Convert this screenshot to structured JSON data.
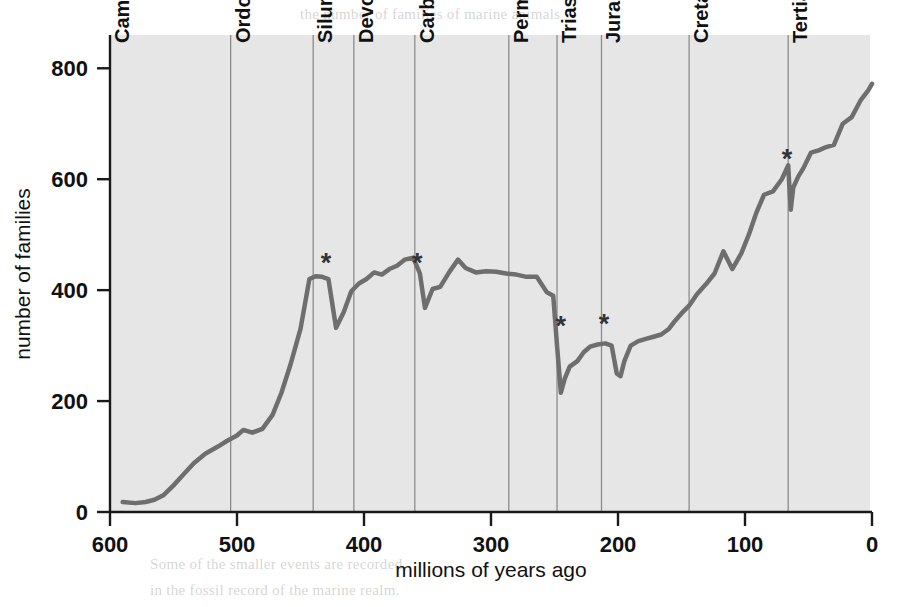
{
  "figure": {
    "background_color": "#ffffff",
    "plot_background_color": "#e6e6e6",
    "curve_color": "#6e6e6e",
    "axis_color": "#1a1a1a",
    "gridline_color": "#8c8c8c",
    "extinction_marker_glyph": "*"
  },
  "chart_data": {
    "type": "line",
    "title": "",
    "xlabel": "millions of years ago",
    "ylabel": "number of families",
    "xlim": [
      600,
      0
    ],
    "ylim": [
      0,
      860
    ],
    "x_reversed": true,
    "grid": "vertical period boundaries only",
    "legend": "none",
    "xticks": [
      600,
      500,
      400,
      300,
      200,
      100,
      0
    ],
    "xtick_labels": [
      "600",
      "500",
      "400",
      "300",
      "200",
      "100",
      "0"
    ],
    "yticks": [
      0,
      200,
      400,
      600,
      800
    ],
    "ytick_labels": [
      "0",
      "200",
      "400",
      "600",
      "800"
    ],
    "series": [
      {
        "name": "number of marine animal families",
        "x": [
          590,
          580,
          572,
          565,
          558,
          550,
          542,
          534,
          525,
          515,
          508,
          500,
          495,
          488,
          480,
          472,
          465,
          458,
          450,
          443,
          438,
          433,
          428,
          422,
          416,
          410,
          404,
          398,
          392,
          386,
          380,
          374,
          368,
          362,
          360,
          356,
          352,
          346,
          340,
          333,
          326,
          320,
          312,
          304,
          296,
          288,
          280,
          272,
          264,
          256,
          251,
          248,
          245,
          242,
          238,
          232,
          227,
          222,
          216,
          210,
          205,
          201,
          198,
          195,
          190,
          184,
          178,
          172,
          166,
          160,
          155,
          150,
          144,
          138,
          131,
          124,
          117,
          110,
          103,
          97,
          91,
          85,
          78,
          71,
          66,
          64,
          62,
          58,
          54,
          48,
          42,
          36,
          30,
          23,
          16,
          9,
          3,
          0
        ],
        "y": [
          18,
          16,
          18,
          22,
          30,
          48,
          68,
          88,
          105,
          118,
          128,
          138,
          148,
          143,
          150,
          175,
          215,
          265,
          330,
          420,
          425,
          424,
          420,
          332,
          360,
          398,
          412,
          420,
          432,
          428,
          438,
          444,
          455,
          458,
          452,
          430,
          368,
          402,
          406,
          432,
          455,
          440,
          432,
          434,
          433,
          430,
          428,
          424,
          424,
          396,
          390,
          300,
          215,
          240,
          262,
          272,
          288,
          298,
          302,
          304,
          300,
          250,
          245,
          272,
          300,
          308,
          312,
          316,
          320,
          330,
          345,
          358,
          372,
          392,
          410,
          430,
          470,
          438,
          466,
          500,
          540,
          572,
          578,
          600,
          625,
          545,
          585,
          605,
          620,
          648,
          652,
          658,
          662,
          700,
          712,
          742,
          760,
          772
        ]
      }
    ],
    "period_boundaries": [
      {
        "label": "Cambrian",
        "start_mya": 600,
        "end_mya": 505
      },
      {
        "label": "Ordovician",
        "start_mya": 505,
        "end_mya": 440
      },
      {
        "label": "Silurian",
        "start_mya": 440,
        "end_mya": 408
      },
      {
        "label": "Devonian",
        "start_mya": 408,
        "end_mya": 360
      },
      {
        "label": "Carboniferous",
        "start_mya": 360,
        "end_mya": 286
      },
      {
        "label": "Permian",
        "start_mya": 286,
        "end_mya": 248
      },
      {
        "label": "Triassic",
        "start_mya": 248,
        "end_mya": 213
      },
      {
        "label": "Jurassic",
        "start_mya": 213,
        "end_mya": 144
      },
      {
        "label": "Cretaceous",
        "start_mya": 144,
        "end_mya": 66
      },
      {
        "label": "Tertiary",
        "start_mya": 66,
        "end_mya": 0
      }
    ],
    "annotations": [
      {
        "label": "*",
        "name": "end-ordovician-extinction",
        "x": 430,
        "y": 432,
        "meaning": "mass extinction"
      },
      {
        "label": "*",
        "name": "late-devonian-extinction",
        "x": 358,
        "y": 432,
        "meaning": "mass extinction"
      },
      {
        "label": "*",
        "name": "end-permian-extinction",
        "x": 245,
        "y": 320,
        "meaning": "mass extinction"
      },
      {
        "label": "*",
        "name": "end-triassic-extinction",
        "x": 211,
        "y": 322,
        "meaning": "mass extinction"
      },
      {
        "label": "*",
        "name": "end-cretaceous-extinction",
        "x": 67,
        "y": 620,
        "meaning": "mass extinction"
      }
    ]
  },
  "page_bleed_text": [
    "the number of families of marine animals",
    "a record of the past 600 million years, and",
    "each of the major mass extinctions is",
    "marked with an asterisk on the curve.",
    "Diversity has generally increased over",
    "time, punctuated by sharp declines.",
    "The pattern of recovery after each event",
    "has been broadly similar in character.",
    "The five largest extinction events are",
    "recognized as the big five; each of them",
    "removed a substantial fraction of all",
    "existing families within a short interval.",
    "Recovery took tens of millions of years",
    "before diversity resumed its climb.",
    "Some of the smaller events are recorded",
    "in the fossil record of the marine realm."
  ]
}
